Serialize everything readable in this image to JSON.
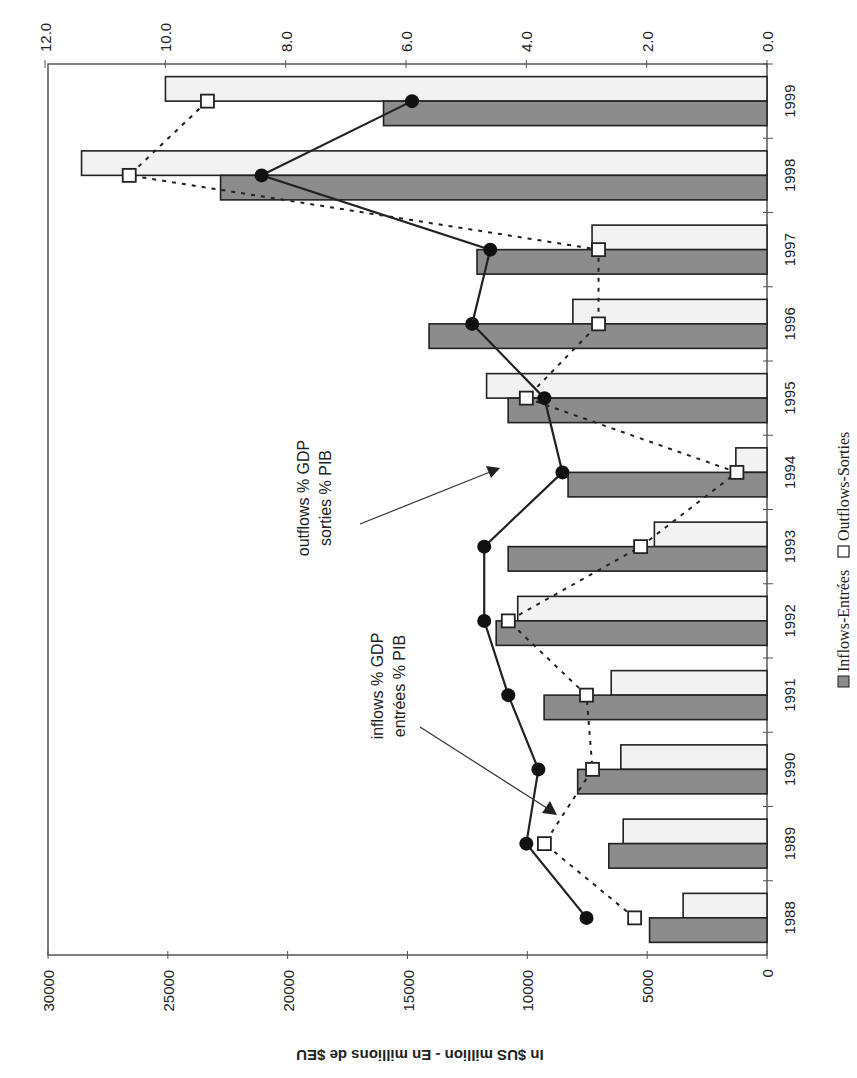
{
  "chart_data": {
    "type": "bar",
    "orientation": "rotated-90-clockwise (horizontal bars with category axis on right)",
    "title": "",
    "categories": [
      "1988",
      "1989",
      "1990",
      "1991",
      "1992",
      "1993",
      "1994",
      "1995",
      "1996",
      "1997",
      "1998",
      "1999"
    ],
    "series": [
      {
        "name": "Inflows-Entrées",
        "kind": "bar",
        "axis": "primary",
        "color": "#8c8c8c",
        "values": [
          4900,
          6600,
          7900,
          9300,
          11300,
          10800,
          8300,
          10800,
          14100,
          12100,
          22800,
          16000
        ]
      },
      {
        "name": "Outflows-Sorties",
        "kind": "bar",
        "axis": "primary",
        "color": "#f2f2f2",
        "values": [
          3500,
          6000,
          6100,
          6500,
          10400,
          4700,
          1300,
          11700,
          8100,
          7300,
          28600,
          25100
        ]
      },
      {
        "name": "inflows % GDP / entrées % PIB",
        "kind": "line",
        "axis": "secondary",
        "marker": "filled-circle",
        "style": "solid",
        "values": [
          3.0,
          4.0,
          3.8,
          4.3,
          4.7,
          4.7,
          3.4,
          3.7,
          4.9,
          4.6,
          8.4,
          5.9
        ]
      },
      {
        "name": "outflows % GDP / sorties % PIB",
        "kind": "line",
        "axis": "secondary",
        "marker": "open-square",
        "style": "dashed",
        "values": [
          2.2,
          3.7,
          2.9,
          3.0,
          4.3,
          2.1,
          0.5,
          4.0,
          2.8,
          2.8,
          10.6,
          9.3
        ]
      }
    ],
    "primary_axis": {
      "label": "In $US million - En millions de $EU",
      "range": [
        0,
        30000
      ],
      "ticks": [
        "0",
        "5000",
        "10000",
        "15000",
        "20000",
        "25000",
        "30000"
      ]
    },
    "secondary_axis": {
      "label": "",
      "range": [
        0,
        12
      ],
      "ticks": [
        "0.0",
        "2.0",
        "4.0",
        "6.0",
        "8.0",
        "10.0",
        "12.0"
      ]
    },
    "annotations": [
      {
        "line1": "inflows % GDP",
        "line2": "entrées % PIB"
      },
      {
        "line1": "outflows % GDP",
        "line2": "sorties % PIB"
      }
    ],
    "legend": {
      "position": "right (rotated)",
      "items": [
        "Inflows-Entrées",
        "Outflows-Sorties"
      ]
    },
    "grid": false
  }
}
